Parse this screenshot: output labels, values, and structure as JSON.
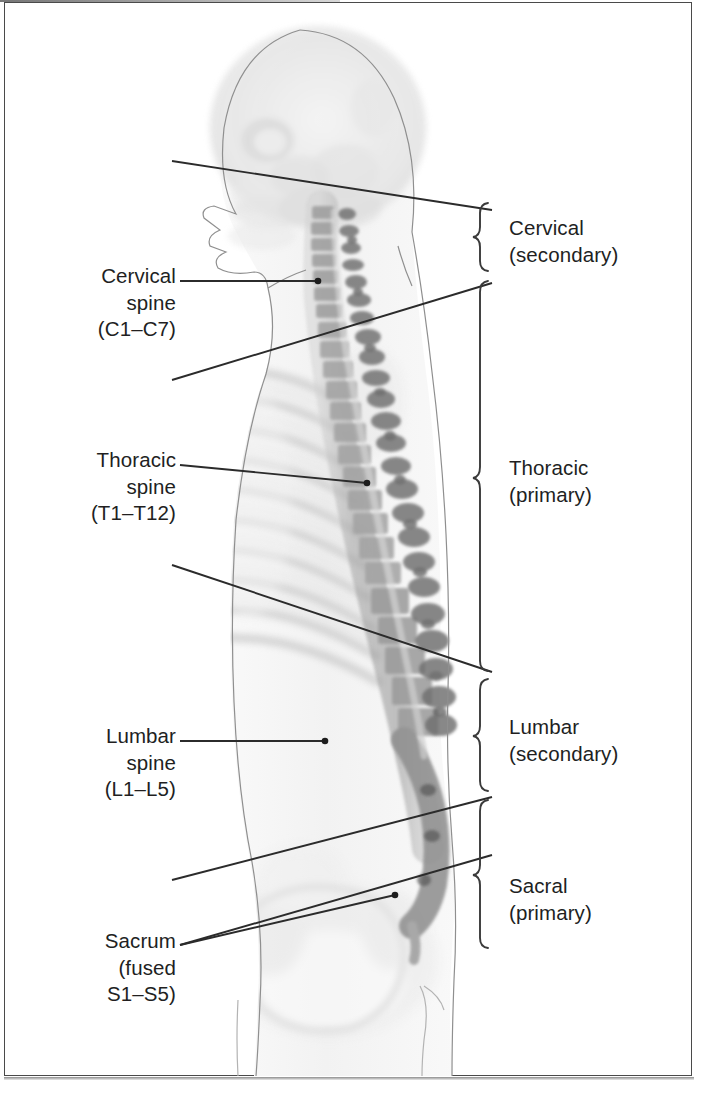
{
  "figure": {
    "modality": "sagittal radiograph with body contour overlay"
  },
  "left_labels": [
    {
      "name": "cervical-spine",
      "text": "Cervical\nspine\n(C1–C7)",
      "x": 34,
      "y": 263,
      "width": 142,
      "leader": {
        "x1": 180,
        "y1": 281,
        "x2": 318,
        "y2": 281,
        "dot": true
      }
    },
    {
      "name": "thoracic-spine",
      "text": "Thoracic\nspine\n(T1–T12)",
      "x": 34,
      "y": 447,
      "width": 142,
      "leader": {
        "x1": 180,
        "y1": 465,
        "x2": 367,
        "y2": 483,
        "dot": true
      }
    },
    {
      "name": "lumbar-spine",
      "text": "Lumbar\nspine\n(L1–L5)",
      "x": 34,
      "y": 723,
      "width": 142,
      "leader": {
        "x1": 180,
        "y1": 741,
        "x2": 325,
        "y2": 741,
        "dot": true
      }
    },
    {
      "name": "sacrum",
      "text": "Sacrum\n(fused\nS1–S5)",
      "x": 34,
      "y": 928,
      "width": 142,
      "leader": {
        "x1": 180,
        "y1": 945,
        "x2": 395,
        "y2": 895,
        "dot": true
      }
    }
  ],
  "right_labels": [
    {
      "name": "cervical-curvature",
      "text": "Cervical\n(secondary)",
      "x": 509,
      "y": 215,
      "brace": {
        "x": 481,
        "top": 203,
        "bottom": 271
      }
    },
    {
      "name": "thoracic-curvature",
      "text": "Thoracic\n(primary)",
      "x": 509,
      "y": 455,
      "brace": {
        "x": 481,
        "top": 281,
        "bottom": 671
      }
    },
    {
      "name": "lumbar-curvature",
      "text": "Lumbar\n(secondary)",
      "x": 509,
      "y": 714,
      "brace": {
        "x": 481,
        "top": 679,
        "bottom": 791
      }
    },
    {
      "name": "sacral-curvature",
      "text": "Sacral\n(primary)",
      "x": 509,
      "y": 873,
      "brace": {
        "x": 481,
        "top": 800,
        "bottom": 948
      }
    }
  ],
  "region_divider_lines": [
    {
      "name": "cervical-thoracic-divider",
      "x1": 172,
      "y1": 161,
      "x2": 492,
      "y2": 210
    },
    {
      "name": "thoracic-upper-divider",
      "x1": 172,
      "y1": 380,
      "x2": 492,
      "y2": 283
    },
    {
      "name": "thoracic-lumbar-divider",
      "x1": 172,
      "y1": 565,
      "x2": 492,
      "y2": 672
    },
    {
      "name": "lumbar-sacral-divider",
      "x1": 172,
      "y1": 880,
      "x2": 492,
      "y2": 797
    },
    {
      "name": "sacral-lower-divider",
      "x1": 180,
      "y1": 945,
      "x2": 492,
      "y2": 855
    }
  ],
  "colors": {
    "ink": "#221f1f",
    "leader": "#2b2b2b",
    "frame": "#4a4a4a",
    "contour": "#8f8f8f",
    "bone_dark": "#6f6f6f",
    "bone_light": "#d8d8d8",
    "background": "#ffffff"
  }
}
